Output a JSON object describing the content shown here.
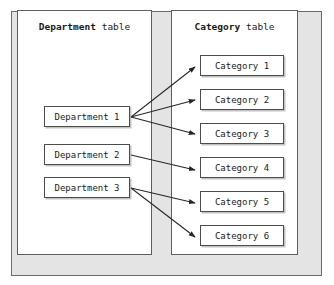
{
  "diagram": {
    "title_department_panel": {
      "entity": "Department",
      "suffix": "table"
    },
    "title_category_panel": {
      "entity": "Category",
      "suffix": "table"
    },
    "departments": [
      {
        "label": "Department 1"
      },
      {
        "label": "Department 2"
      },
      {
        "label": "Department 3"
      }
    ],
    "categories": [
      {
        "label": "Category 1"
      },
      {
        "label": "Category 2"
      },
      {
        "label": "Category 3"
      },
      {
        "label": "Category 4"
      },
      {
        "label": "Category 5"
      },
      {
        "label": "Category 6"
      }
    ],
    "relationships": [
      {
        "from": "Department 1",
        "to": "Category 1"
      },
      {
        "from": "Department 1",
        "to": "Category 2"
      },
      {
        "from": "Department 1",
        "to": "Category 3"
      },
      {
        "from": "Department 2",
        "to": "Category 4"
      },
      {
        "from": "Department 3",
        "to": "Category 5"
      },
      {
        "from": "Department 3",
        "to": "Category 6"
      }
    ],
    "colors": {
      "outer_frame_fill": "#e4e4e4",
      "outer_frame_border": "#6b6b6b",
      "panel_fill": "#ffffff",
      "panel_border": "#5e5e5e",
      "box_border": "#4d4d4d",
      "arrow": "#262626",
      "text": "#1a1a1a",
      "page_background": "#ffffff"
    }
  }
}
